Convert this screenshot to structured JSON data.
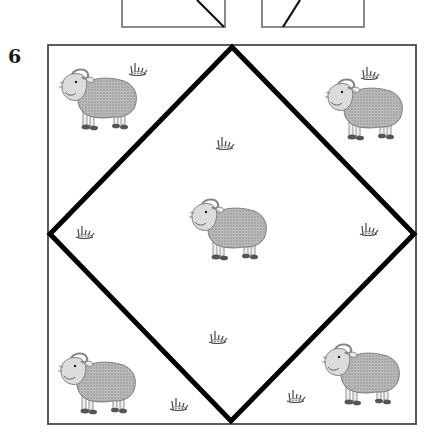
{
  "exercise": {
    "number": "6",
    "description": "Square frame with inscribed diamond; sheep and grass tufts placed in regions"
  },
  "colors": {
    "frame": "#555555",
    "diamond": "#000000",
    "sheep_body": "#a8a8a8",
    "sheep_outline": "#6f6f6f",
    "grass": "#444444"
  },
  "top_boxes": [
    {
      "name": "left-top-box",
      "diagonal": "down-right"
    },
    {
      "name": "right-top-box",
      "diagonal": "down-left"
    }
  ],
  "sheep": [
    {
      "position": "top-left",
      "facing": "left"
    },
    {
      "position": "top-right",
      "facing": "left"
    },
    {
      "position": "center",
      "facing": "left"
    },
    {
      "position": "bottom-left",
      "facing": "left"
    },
    {
      "position": "bottom-right",
      "facing": "left"
    }
  ],
  "grass_tufts": [
    {
      "position": "top-left-corner"
    },
    {
      "position": "top-right-corner"
    },
    {
      "position": "inside-top"
    },
    {
      "position": "inside-left"
    },
    {
      "position": "inside-right"
    },
    {
      "position": "inside-bottom"
    },
    {
      "position": "bottom-left-corner"
    },
    {
      "position": "bottom-right-corner"
    }
  ]
}
